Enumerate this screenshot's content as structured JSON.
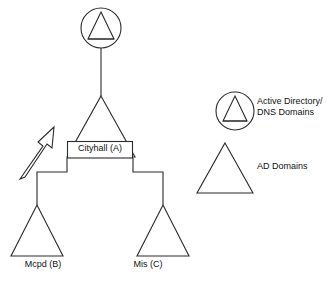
{
  "diagram": {
    "nodes": {
      "root": {
        "icon": "circled-triangle-icon",
        "type": "Active Directory/DNS Domain"
      },
      "parent_domain": {
        "label": "Cityhall (A)",
        "icon": "triangle-icon"
      },
      "child_domain_left": {
        "label": "Mcpd (B)",
        "icon": "triangle-icon"
      },
      "child_domain_right": {
        "label": "Mis (C)",
        "icon": "triangle-icon"
      }
    },
    "annotation": {
      "icon": "outline-arrow-up-right-icon"
    }
  },
  "legend": {
    "items": [
      {
        "icon": "circled-triangle-icon",
        "line1": "Active Directory/",
        "line2": "DNS Domains"
      },
      {
        "icon": "triangle-icon",
        "label": "AD Domains"
      }
    ]
  },
  "colors": {
    "stroke": "#2b2b2b",
    "background": "#ffffff",
    "text": "#111111"
  }
}
